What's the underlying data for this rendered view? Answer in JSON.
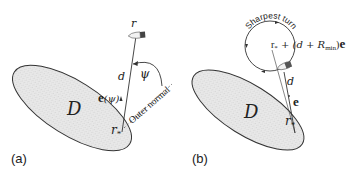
{
  "figure": {
    "panels": [
      {
        "id": "a",
        "label": "(a)",
        "region_label": "D",
        "point_label_base": "r",
        "point_label_sub": "*",
        "vehicle_label": "r",
        "distance_label": "d",
        "direction_label": "e(ψ)",
        "direction_bold": "e",
        "direction_arg": "(ψ)",
        "angle_label": "ψ",
        "normal_label": "Outer normal"
      },
      {
        "id": "b",
        "label": "(b)",
        "region_label": "D",
        "point_label_base": "r",
        "point_label_sub": "*",
        "distance_label": "d",
        "direction_label": "e",
        "circle_label": "Sharpest turn",
        "center_formula_prefix": "r",
        "center_formula_sub": "*",
        "center_formula_mid": " + (d + R",
        "center_formula_rsub": "min",
        "center_formula_end": ")",
        "center_formula_bold": "e"
      }
    ],
    "colors": {
      "region_fill": "#e6e6e6",
      "stroke": "#333333",
      "text": "#222222",
      "boat_dark": "#444444"
    }
  }
}
